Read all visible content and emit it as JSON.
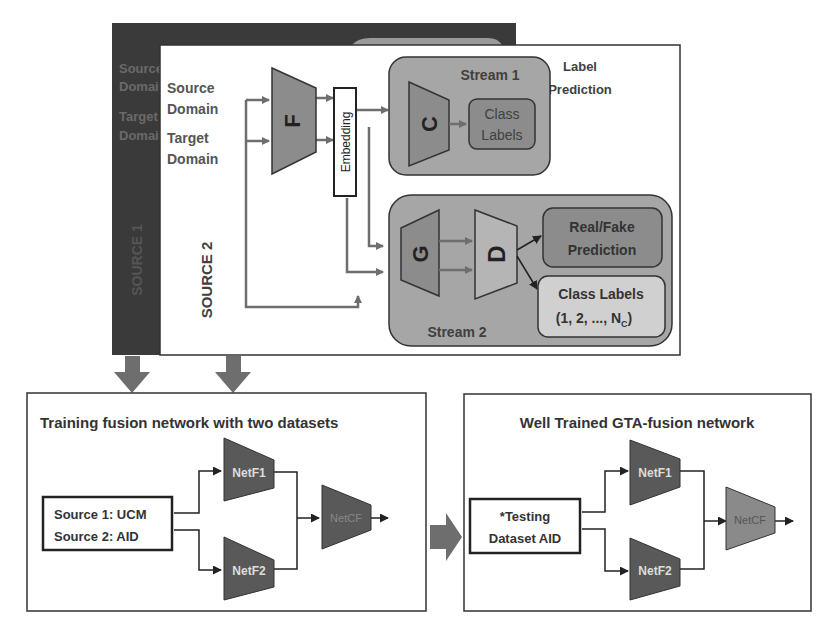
{
  "source1_panel": {
    "label": "SOURCE 1",
    "faded_text": [
      "Source",
      "Domain",
      "Target",
      "Domain"
    ]
  },
  "source2_panel": {
    "label": "SOURCE 2",
    "inputs": {
      "source_domain": [
        "Source",
        "Domain"
      ],
      "target_domain": [
        "Target",
        "Domain"
      ]
    },
    "feature_extractor": "F",
    "embedding": "Embedding",
    "label_prediction": [
      "Label",
      "Prediction"
    ],
    "stream1": {
      "title": "Stream 1",
      "classifier": "C",
      "output": [
        "Class",
        "Labels"
      ]
    },
    "stream2": {
      "title": "Stream 2",
      "generator": "G",
      "discriminator": "D",
      "output_real_fake": [
        "Real/Fake",
        "Prediction"
      ],
      "output_class_labels": [
        "Class Labels",
        "(1, 2, ..., N",
        "C",
        ")"
      ]
    }
  },
  "training_box": {
    "title": "Training fusion network with two datasets",
    "input": [
      "Source 1: UCM",
      "Source 2: AID"
    ],
    "net1": "NetF1",
    "net2": "NetF2",
    "fusion": "NetCF"
  },
  "testing_box": {
    "title": "Well Trained GTA-fusion network",
    "input": [
      "*Testing",
      "Dataset AID"
    ],
    "net1": "NetF1",
    "net2": "NetF2",
    "fusion": "NetCF"
  },
  "colors": {
    "dark_panel": "#3a3a3a",
    "stream_fill": "#a6a6a6",
    "module_fill": "#8c8c8c",
    "net_fill": "#595959",
    "arrow": "#6e6e6e",
    "text": "#404040"
  }
}
